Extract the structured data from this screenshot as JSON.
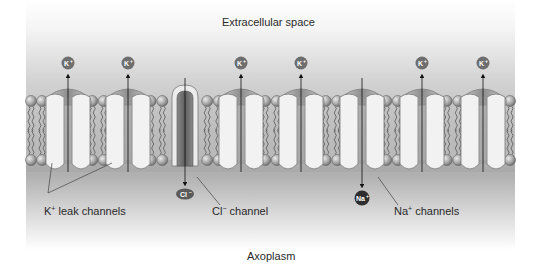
{
  "title_top": "Extracellular space",
  "title_bottom": "Axoplasm",
  "labels": {
    "k_leak": {
      "base": "K",
      "sup": "+",
      "rest": " leak channels"
    },
    "cl_channel": {
      "base": "Cl",
      "sup": "−",
      "rest": " channel"
    },
    "na_channels": {
      "base": "Na",
      "sup": "+",
      "rest": " channels"
    }
  },
  "ions": {
    "k": {
      "text": "K",
      "sup": "+",
      "color": "#6e6e6e"
    },
    "cl": {
      "text": "Cl",
      "sup": "−",
      "color": "#5a5a5a"
    },
    "na": {
      "text": "Na",
      "sup": "+",
      "color": "#2e2e2e"
    }
  },
  "channels": [
    {
      "type": "K+ leak",
      "x": 68,
      "direction": "out"
    },
    {
      "type": "K+ leak",
      "x": 128,
      "direction": "out"
    },
    {
      "type": "Cl-",
      "x": 185,
      "direction": "in"
    },
    {
      "type": "K+ leak",
      "x": 241,
      "direction": "out"
    },
    {
      "type": "K+ leak",
      "x": 301,
      "direction": "out"
    },
    {
      "type": "Na+",
      "x": 362,
      "direction": "in"
    },
    {
      "type": "K+ leak",
      "x": 422,
      "direction": "out"
    },
    {
      "type": "K+ leak",
      "x": 483,
      "direction": "out"
    }
  ],
  "colors": {
    "membrane_gray": "#b9b9b9",
    "axoplasm_gray": "#a8a8a8",
    "protein": "#f2f2f2",
    "protein_edge": "#777777",
    "lipid_head": "#a9a9a9",
    "cl_channel": "#6f6f6f"
  }
}
